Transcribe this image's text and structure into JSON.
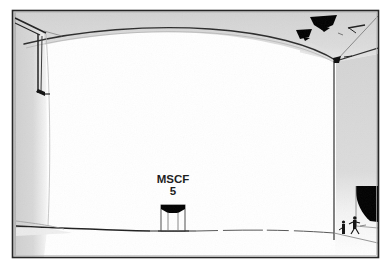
{
  "figure": {
    "kind": "line-drawing",
    "border": {
      "present": true,
      "color": "#262626",
      "x": 12,
      "y": 10,
      "width": 367,
      "height": 248
    },
    "background_color": "#ffffff",
    "wall_gray": "#d6d6d6",
    "wall_gray_dark": "#c2c2c2",
    "line_color": "#1a1a1a",
    "ink_black": "#000000"
  },
  "annotations": {
    "structure_label": {
      "line1": "MSCF",
      "line2": "5",
      "x": 178,
      "y": 180
    }
  },
  "scene": {
    "ceiling": {
      "name": "vaulted ceiling",
      "color": "#d6d6d6"
    },
    "back_wall": {
      "name": "back wall",
      "color": "#ffffff"
    },
    "left_wall": {
      "name": "left side wall",
      "color": "#d6d6d6"
    },
    "right_wall": {
      "name": "right side wall",
      "color": "#d6d6d6"
    },
    "floor": {
      "name": "floor",
      "color": "#ffffff"
    },
    "pedestal": {
      "name": "central labeled structure",
      "x": 161,
      "y": 203,
      "width": 24,
      "height": 26,
      "cap_color": "#000000"
    },
    "ceiling_fixtures": [
      {
        "name": "ceiling-vent-large",
        "x": 318,
        "y": 17
      },
      {
        "name": "ceiling-vent-small",
        "x": 300,
        "y": 30
      },
      {
        "name": "ceiling-mark-right",
        "x": 352,
        "y": 30
      }
    ],
    "hanging_beam": {
      "name": "left hanging beam",
      "top_y": 22,
      "bottom_y": 95,
      "x": 38
    },
    "dark_opening": {
      "name": "dark opening at right wall",
      "x": 355,
      "y": 185,
      "width": 24,
      "height": 35,
      "color": "#000000"
    },
    "people": [
      {
        "name": "person-left",
        "x": 344,
        "y": 228
      },
      {
        "name": "person-right",
        "x": 355,
        "y": 225
      }
    ]
  }
}
